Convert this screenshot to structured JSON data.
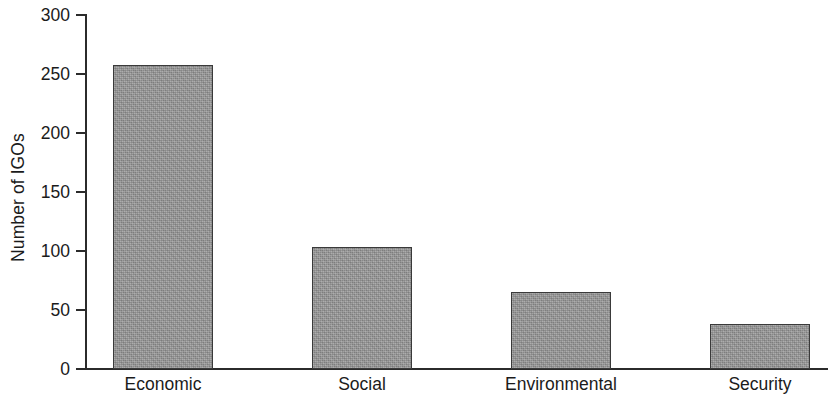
{
  "chart_data": {
    "type": "bar",
    "title": "",
    "subtitle": "",
    "xlabel": "",
    "ylabel": "Number of IGOs",
    "categories": [
      "Economic",
      "Social",
      "Environmental",
      "Security"
    ],
    "values": [
      258,
      103,
      65,
      38
    ],
    "series": [
      {
        "name": "Number of IGOs",
        "values": [
          258,
          103,
          65,
          38
        ]
      }
    ],
    "ylim": [
      0,
      300
    ],
    "yticks": [
      0,
      50,
      100,
      150,
      200,
      250,
      300
    ],
    "ytick_labels": [
      "0",
      "50",
      "100",
      "150",
      "200",
      "250",
      "300"
    ],
    "grid": false,
    "legend": false,
    "legend_position": "none",
    "bar_color": "#969696",
    "bar_edge_color": "#3a3a3a",
    "axis_color": "#2b2b2b",
    "text_color": "#1b1b1b",
    "background_color": "#ffffff",
    "annotations": []
  }
}
